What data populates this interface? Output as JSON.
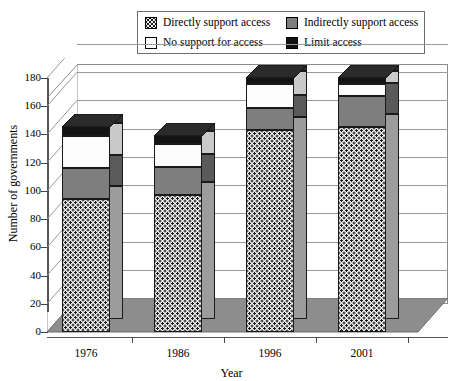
{
  "legend": {
    "items": [
      {
        "label": "Directly support access",
        "swatch": "dotted-swatch-icon"
      },
      {
        "label": "Indirectly support access",
        "swatch": "gray-swatch-icon"
      },
      {
        "label": "No support for access",
        "swatch": "white-swatch-icon"
      },
      {
        "label": "Limit access",
        "swatch": "black-swatch-icon"
      }
    ]
  },
  "chart_data": {
    "type": "bar",
    "subtype": "stacked-3d-column",
    "title": "",
    "xlabel": "Year",
    "ylabel": "Number of governments",
    "categories": [
      "1976",
      "1986",
      "1996",
      "2001"
    ],
    "ylim": [
      0,
      180
    ],
    "yticks": [
      0,
      20,
      40,
      60,
      80,
      100,
      120,
      140,
      160,
      180
    ],
    "grid": true,
    "legend_position": "top",
    "series": [
      {
        "name": "Directly support access",
        "values": [
          94,
          97,
          143,
          145
        ]
      },
      {
        "name": "Indirectly support access",
        "values": [
          22,
          20,
          16,
          22
        ]
      },
      {
        "name": "No support for access",
        "values": [
          23,
          16,
          17,
          9
        ]
      },
      {
        "name": "Limit access",
        "values": [
          6,
          6,
          4,
          4
        ]
      }
    ],
    "totals": [
      145,
      139,
      180,
      180
    ]
  },
  "colors": {
    "directly_support": "#f0f0f0",
    "indirectly_support": "#7e7e7e",
    "no_support": "#fdfdfd",
    "limit_access": "#141414",
    "floor": "#8d8d8d",
    "grid": "#9a9a9a"
  }
}
